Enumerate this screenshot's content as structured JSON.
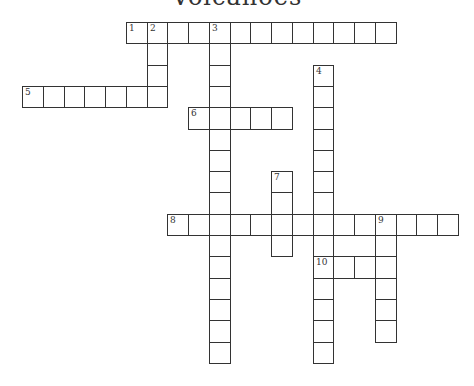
{
  "title": "Volcanoes",
  "grid": {
    "origin_x": 22,
    "origin_y": 22,
    "cell_w": 20.75,
    "cell_h": 21.3,
    "line_color": "#333333"
  },
  "entries": [
    {
      "number": "1",
      "direction": "across",
      "row": 0,
      "col": 5,
      "length": 13
    },
    {
      "number": "2",
      "direction": "down",
      "row": 0,
      "col": 6,
      "length": 4
    },
    {
      "number": "3",
      "direction": "down",
      "row": 0,
      "col": 9,
      "length": 16
    },
    {
      "number": "4",
      "direction": "down",
      "row": 2,
      "col": 14,
      "length": 14
    },
    {
      "number": "5",
      "direction": "across",
      "row": 3,
      "col": 0,
      "length": 7
    },
    {
      "number": "6",
      "direction": "across",
      "row": 4,
      "col": 8,
      "length": 5
    },
    {
      "number": "7",
      "direction": "down",
      "row": 7,
      "col": 12,
      "length": 4
    },
    {
      "number": "8",
      "direction": "across",
      "row": 9,
      "col": 7,
      "length": 14
    },
    {
      "number": "9",
      "direction": "down",
      "row": 9,
      "col": 17,
      "length": 6
    },
    {
      "number": "10",
      "direction": "across",
      "row": 11,
      "col": 14,
      "length": 4
    }
  ]
}
